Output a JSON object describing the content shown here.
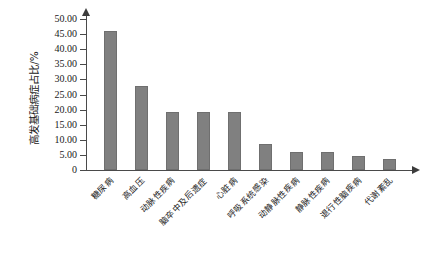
{
  "chart_data": {
    "type": "bar",
    "title": "",
    "xlabel": "",
    "ylabel": "高发基础病症占比/%",
    "ylim": [
      0,
      50
    ],
    "ytick_labels": [
      "50.00",
      "45.00",
      "40.00",
      "35.00",
      "30.00",
      "25.00",
      "20.00",
      "15.00",
      "10.00",
      "5.00",
      "0"
    ],
    "ytick_values": [
      50,
      45,
      40,
      35,
      30,
      25,
      20,
      15,
      10,
      5,
      0
    ],
    "grid": false,
    "legend": false,
    "categories": [
      "糖尿病",
      "高血压",
      "动脉性疾病",
      "脑卒中及后遗症",
      "心脏病",
      "呼吸系统感染",
      "动静脉性疾病",
      "静脉性疾病",
      "退行性脑疾病",
      "代谢紊乱"
    ],
    "values": [
      46.0,
      27.8,
      19.1,
      19.1,
      19.1,
      8.5,
      5.8,
      5.8,
      4.6,
      3.5
    ],
    "bar_color": "#808080",
    "axis_color": "#4a4a4a",
    "background": "#ffffff"
  }
}
